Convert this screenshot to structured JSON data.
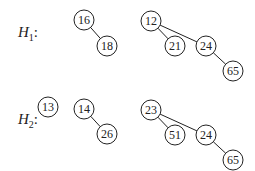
{
  "heaps": [
    {
      "name": "H",
      "sub": "1",
      "label_pos": [
        18,
        24
      ],
      "nodes": [
        {
          "id": "a",
          "value": "16",
          "x": 84,
          "y": 20
        },
        {
          "id": "b",
          "value": "18",
          "x": 107,
          "y": 46
        },
        {
          "id": "c",
          "value": "12",
          "x": 151,
          "y": 21
        },
        {
          "id": "d",
          "value": "21",
          "x": 175,
          "y": 46
        },
        {
          "id": "e",
          "value": "24",
          "x": 206,
          "y": 46
        },
        {
          "id": "f",
          "value": "65",
          "x": 233,
          "y": 71
        }
      ],
      "edges": [
        [
          "a",
          "b"
        ],
        [
          "c",
          "d"
        ],
        [
          "c",
          "e"
        ],
        [
          "e",
          "f"
        ]
      ]
    },
    {
      "name": "H",
      "sub": "2",
      "label_pos": [
        18,
        111
      ],
      "nodes": [
        {
          "id": "a",
          "value": "13",
          "x": 48,
          "y": 107
        },
        {
          "id": "b",
          "value": "14",
          "x": 84,
          "y": 109
        },
        {
          "id": "c",
          "value": "26",
          "x": 107,
          "y": 134
        },
        {
          "id": "d",
          "value": "23",
          "x": 151,
          "y": 110
        },
        {
          "id": "e",
          "value": "51",
          "x": 175,
          "y": 135
        },
        {
          "id": "f",
          "value": "24",
          "x": 206,
          "y": 135
        },
        {
          "id": "g",
          "value": "65",
          "x": 233,
          "y": 160
        }
      ],
      "edges": [
        [
          "b",
          "c"
        ],
        [
          "d",
          "e"
        ],
        [
          "d",
          "f"
        ],
        [
          "f",
          "g"
        ]
      ]
    }
  ],
  "style": {
    "stroke": "#222222",
    "radius": 10
  }
}
